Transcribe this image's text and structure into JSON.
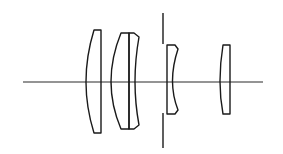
{
  "diagram": {
    "type": "optical-lens-layout",
    "elements": [
      {
        "id": "lens-1",
        "kind": "plano-convex singlet"
      },
      {
        "id": "lens-2",
        "kind": "cemented doublet"
      },
      {
        "id": "aperture-stop",
        "kind": "aperture stop"
      },
      {
        "id": "lens-3",
        "kind": "plano-concave singlet"
      },
      {
        "id": "lens-4",
        "kind": "plano-convex singlet"
      }
    ],
    "colors": {
      "line": "#1a1a1a",
      "background": "#ffffff"
    }
  }
}
